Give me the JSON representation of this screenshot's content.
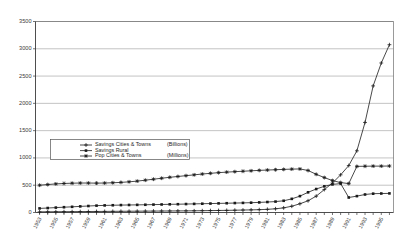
{
  "chart_data": {
    "type": "line",
    "title": "",
    "xlabel": "",
    "ylabel": "",
    "ylim": [
      0,
      3500
    ],
    "yticks": [
      0,
      500,
      1000,
      1500,
      2000,
      2500,
      3000,
      3500
    ],
    "grid": true,
    "legend_position": "center-left",
    "x": [
      "1953",
      "1954",
      "1955",
      "1956",
      "1957",
      "1958",
      "1959",
      "1960",
      "1961",
      "1962",
      "1963",
      "1964",
      "1965",
      "1966",
      "1967",
      "1968",
      "1969",
      "1970",
      "1971",
      "1972",
      "1973",
      "1974",
      "1975",
      "1976",
      "1977",
      "1978",
      "1979",
      "1980",
      "1981",
      "1982",
      "1983",
      "1984",
      "1985",
      "1986",
      "1987",
      "1988",
      "1989",
      "1990",
      "1991",
      "1992",
      "1993",
      "1994",
      "1995",
      "1996"
    ],
    "xtick_labels": [
      "1953",
      "1955",
      "1957",
      "1959",
      "1961",
      "1963",
      "1965",
      "1967",
      "1969",
      "1971",
      "1973",
      "1975",
      "1977",
      "1979",
      "1981",
      "1983",
      "1985",
      "1987",
      "1989",
      "1991",
      "1993",
      "1995"
    ],
    "series": [
      {
        "name": "Savings Cities & Towns",
        "unit": "(Billions)",
        "marker": "plus",
        "values": [
          12,
          13,
          14,
          15,
          16,
          17,
          18,
          19,
          20,
          21,
          22,
          23,
          24,
          25,
          26,
          27,
          28,
          29,
          30,
          31,
          33,
          35,
          37,
          39,
          42,
          45,
          48,
          52,
          58,
          68,
          85,
          115,
          160,
          215,
          300,
          420,
          540,
          690,
          860,
          1130,
          1650,
          2320,
          2740,
          3075
        ]
      },
      {
        "name": "Savings Rural",
        "unit": "",
        "marker": "square",
        "values": [
          75,
          82,
          90,
          97,
          104,
          112,
          119,
          126,
          130,
          133,
          136,
          138,
          140,
          142,
          145,
          147,
          150,
          152,
          155,
          158,
          161,
          164,
          167,
          170,
          173,
          176,
          180,
          185,
          192,
          200,
          215,
          250,
          300,
          370,
          430,
          480,
          515,
          530,
          275,
          300,
          330,
          345,
          348,
          350
        ]
      },
      {
        "name": "Pop Cities & Towns",
        "unit": "(Millions)",
        "marker": "star",
        "values": [
          500,
          512,
          524,
          532,
          537,
          540,
          540,
          538,
          540,
          545,
          552,
          562,
          575,
          592,
          610,
          628,
          645,
          660,
          675,
          690,
          705,
          718,
          730,
          740,
          748,
          756,
          764,
          772,
          778,
          784,
          790,
          795,
          798,
          770,
          700,
          640,
          585,
          548,
          530,
          845,
          848,
          850,
          850,
          852
        ]
      }
    ]
  }
}
